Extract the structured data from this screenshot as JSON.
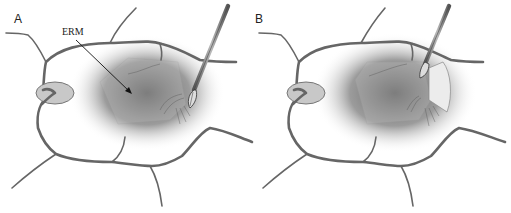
{
  "figure": {
    "panels": [
      {
        "id": "A",
        "label": "A",
        "annotation": "ERM",
        "state": "forceps grasping membrane edge"
      },
      {
        "id": "B",
        "label": "B",
        "annotation": "",
        "state": "membrane flap being peeled"
      }
    ]
  },
  "colors": {
    "vessel": "#666666",
    "optic_disc": "#c8c8c8",
    "shadow": "#6e6e6e",
    "membrane": "#bdbdbd",
    "peeled_flap": "#ececec",
    "instrument": "#8a8a8a"
  },
  "icons": {
    "instrument": "forceps-icon",
    "pointer": "arrow-icon"
  }
}
